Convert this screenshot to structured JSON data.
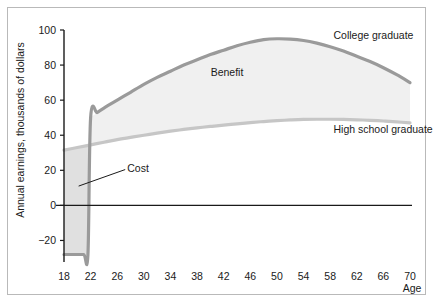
{
  "chart_data": {
    "type": "area",
    "title": "",
    "subtitle": "",
    "xlabel": "Age",
    "ylabel": "Annual earnings, thousands of dollars",
    "xlim": [
      18,
      70
    ],
    "ylim": [
      -30,
      100
    ],
    "xticks": [
      18,
      22,
      26,
      30,
      34,
      38,
      42,
      46,
      50,
      54,
      58,
      62,
      66,
      70
    ],
    "yticks": [
      -20,
      0,
      20,
      40,
      60,
      80,
      100
    ],
    "xtick_labels": [
      "18",
      "22",
      "26",
      "30",
      "34",
      "38",
      "42",
      "46",
      "50",
      "54",
      "58",
      "62",
      "66",
      "70"
    ],
    "ytick_labels": [
      "−20",
      "0",
      "20",
      "40",
      "60",
      "80",
      "100"
    ],
    "grid": false,
    "legend_position": "inline-annotations",
    "zero_line": 0,
    "series": [
      {
        "name": "College graduate",
        "color": "#9a9a9a",
        "x": [
          18,
          19,
          20,
          21,
          21.6,
          22,
          23,
          24,
          26,
          28,
          30,
          32,
          34,
          36,
          38,
          40,
          42,
          44,
          46,
          48,
          50,
          52,
          54,
          56,
          58,
          60,
          62,
          64,
          66,
          68,
          70
        ],
        "values": [
          -28,
          -28,
          -28,
          -28,
          -28,
          50,
          53,
          55.5,
          60,
          64.5,
          69,
          73,
          76.5,
          80,
          83,
          86,
          88.5,
          91,
          93,
          94.5,
          95,
          94.8,
          94,
          92.5,
          90.5,
          88,
          85,
          82,
          78.5,
          74.5,
          70
        ]
      },
      {
        "name": "High school graduate",
        "color": "#c6c6c6",
        "x": [
          18,
          20,
          22,
          24,
          26,
          28,
          30,
          32,
          34,
          36,
          38,
          40,
          42,
          44,
          46,
          48,
          50,
          52,
          54,
          56,
          58,
          60,
          62,
          64,
          66,
          68,
          70
        ],
        "values": [
          31.5,
          33,
          34.5,
          36,
          37.5,
          38.8,
          40,
          41.2,
          42.3,
          43.3,
          44.2,
          45,
          45.8,
          46.5,
          47.2,
          47.8,
          48.3,
          48.7,
          49,
          49.1,
          49.1,
          49,
          48.8,
          48.5,
          48.1,
          47.6,
          47
        ]
      }
    ],
    "regions": [
      {
        "name": "Cost",
        "label": "Cost",
        "fill": "#e0e0e0",
        "x_start": 18,
        "x_end": 22,
        "label_x": 27.5,
        "label_y": 21
      },
      {
        "name": "Benefit",
        "label": "Benefit",
        "fill": "#f0f0f0",
        "x_start": 22,
        "x_end": 70,
        "label_x": 42.5,
        "label_y": 74
      }
    ],
    "annotations": [
      {
        "name": "college-graduate-label",
        "text": "College graduate",
        "x": 58.5,
        "y": 95
      },
      {
        "name": "high-school-graduate-label",
        "text": "High school graduate",
        "x": 58.5,
        "y": 41
      }
    ]
  },
  "axes": {
    "y_axis_title": "Annual earnings, thousands of dollars",
    "x_axis_title": "Age"
  },
  "colors": {
    "college_line": "#9a9a9a",
    "highschool_line": "#c6c6c6",
    "cost_fill": "#e0e0e0",
    "benefit_fill": "#f0f0f0",
    "axis": "#1a1a1a",
    "frame": "#b9b9b9",
    "background": "#ffffff"
  }
}
